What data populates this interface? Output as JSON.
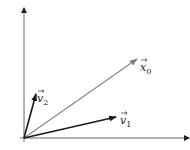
{
  "diagram": {
    "type": "vector-diagram",
    "origin": [
      24,
      138
    ],
    "axes": {
      "x_axis": {
        "from": [
          20,
          138
        ],
        "to": [
          189,
          138
        ],
        "color": "#555555"
      },
      "y_axis": {
        "from": [
          24,
          142
        ],
        "to": [
          24,
          8
        ],
        "color": "#555555"
      }
    },
    "vectors": [
      {
        "name": "v1",
        "label_base": "v",
        "label_sub": "1",
        "from": [
          24,
          138
        ],
        "to": [
          116,
          117
        ],
        "color": "#1a1a1a",
        "label_pos": [
          120,
          121
        ]
      },
      {
        "name": "v2",
        "label_base": "v",
        "label_sub": "2",
        "from": [
          24,
          138
        ],
        "to": [
          36,
          94
        ],
        "color": "#1a1a1a",
        "label_pos": [
          38,
          101
        ]
      },
      {
        "name": "x0",
        "label_base": "x",
        "label_sub": "0",
        "from": [
          24,
          138
        ],
        "to": [
          137,
          59
        ],
        "color": "#808080",
        "label_pos": [
          140,
          67
        ]
      }
    ]
  }
}
